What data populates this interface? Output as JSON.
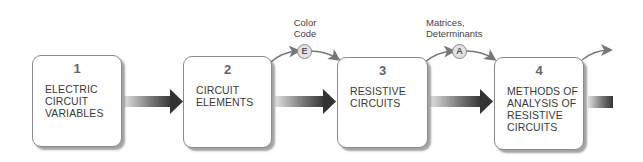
{
  "diagram": {
    "type": "chapter-flow",
    "boxes": [
      {
        "number": "1",
        "label": "ELECTRIC\nCIRCUIT\nVARIABLES"
      },
      {
        "number": "2",
        "label": "CIRCUIT\nELEMENTS"
      },
      {
        "number": "3",
        "label": "RESISTIVE\nCIRCUITS"
      },
      {
        "number": "4",
        "label": "METHODS OF\nANALYSIS OF\nRESISTIVE\nCIRCUITS"
      }
    ],
    "side_topics": [
      {
        "badge": "E",
        "note": "Color\nCode",
        "between": [
          "2",
          "3"
        ]
      },
      {
        "badge": "A",
        "note": "Matrices,\nDeterminants",
        "between": [
          "3",
          "4"
        ]
      }
    ],
    "colors": {
      "box_border": "#8a8a8a",
      "arrow_dark": "#3a3a3a",
      "arrow_light": "#d8d8d8",
      "badge_fill": "#e2e2e2",
      "text": "#3a3a3a"
    }
  }
}
